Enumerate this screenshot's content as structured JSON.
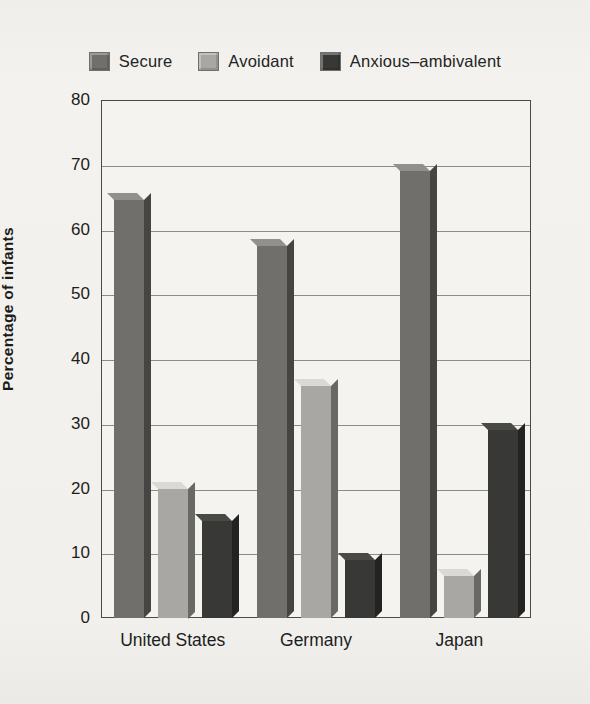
{
  "chart_data": {
    "type": "bar",
    "title": "",
    "xlabel": "",
    "ylabel": "Percentage of infants",
    "ylim": [
      0,
      80
    ],
    "ytick_labels": [
      "80",
      "70",
      "60",
      "50",
      "40",
      "30",
      "20",
      "10",
      "0"
    ],
    "ytick_values": [
      80,
      70,
      60,
      50,
      40,
      30,
      20,
      10,
      0
    ],
    "grid": true,
    "legend_position": "top-center",
    "categories": [
      "United States",
      "Germany",
      "Japan"
    ],
    "series": [
      {
        "name": "Secure",
        "color": "#706f6c",
        "values": [
          64.5,
          57.5,
          69.0
        ]
      },
      {
        "name": "Avoidant",
        "color": "#a8a7a3",
        "values": [
          20.0,
          35.8,
          6.5
        ]
      },
      {
        "name": "Anxious–ambivalent",
        "color": "#383836",
        "values": [
          15.0,
          9.0,
          29.0
        ]
      }
    ]
  },
  "legend": {
    "items": [
      {
        "label": "Secure",
        "swatch_name": "legend-swatch-secure"
      },
      {
        "label": "Avoidant",
        "swatch_name": "legend-swatch-avoidant"
      },
      {
        "label": "Anxious–ambivalent",
        "swatch_name": "legend-swatch-anxious-ambivalent"
      }
    ]
  },
  "colors": {
    "secure": "#706f6c",
    "avoidant": "#a8a7a3",
    "anxious_ambivalent": "#383836",
    "page_background": "#f2f1ed",
    "plot_background": "#f4f3ef",
    "axis": "#4a4a48",
    "gridline": "#8b8b87",
    "text": "#1d1d1d"
  }
}
